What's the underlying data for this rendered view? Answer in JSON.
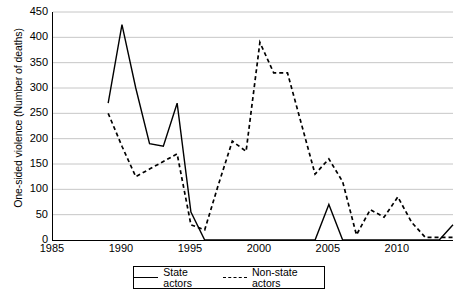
{
  "chart_data": {
    "type": "line",
    "title": "",
    "xlabel": "",
    "ylabel": "One-sided violence (Number of deaths)",
    "xlim": [
      1985,
      2014
    ],
    "ylim": [
      0,
      450
    ],
    "yticks": [
      0,
      50,
      100,
      150,
      200,
      250,
      300,
      350,
      400,
      450
    ],
    "xticks": [
      1985,
      1990,
      1995,
      2000,
      2005,
      2010
    ],
    "grid": "horizontal",
    "legend_position": "bottom-center",
    "series": [
      {
        "name": "State actors",
        "style": "solid",
        "color": "#000000",
        "x": [
          1989,
          1990,
          1991,
          1992,
          1993,
          1994,
          1995,
          1996,
          1997,
          1998,
          1999,
          2000,
          2001,
          2002,
          2003,
          2004,
          2005,
          2006,
          2007,
          2008,
          2009,
          2010,
          2011,
          2012,
          2013,
          2014
        ],
        "values": [
          270,
          425,
          300,
          190,
          185,
          270,
          55,
          0,
          0,
          0,
          0,
          0,
          0,
          0,
          0,
          0,
          70,
          0,
          0,
          0,
          0,
          0,
          0,
          0,
          0,
          30
        ]
      },
      {
        "name": "Non-state actors",
        "style": "dashed",
        "color": "#000000",
        "x": [
          1989,
          1990,
          1991,
          1992,
          1993,
          1994,
          1995,
          1996,
          1997,
          1998,
          1999,
          2000,
          2001,
          2002,
          2003,
          2004,
          2005,
          2006,
          2007,
          2008,
          2009,
          2010,
          2011,
          2012,
          2013,
          2014
        ],
        "values": [
          250,
          185,
          125,
          140,
          155,
          170,
          30,
          20,
          110,
          195,
          175,
          390,
          330,
          330,
          230,
          130,
          160,
          115,
          10,
          60,
          45,
          85,
          35,
          5,
          5,
          5
        ]
      }
    ],
    "legend": [
      {
        "label": "State actors",
        "style": "solid"
      },
      {
        "label": "Non-state actors",
        "style": "dashed"
      }
    ]
  }
}
